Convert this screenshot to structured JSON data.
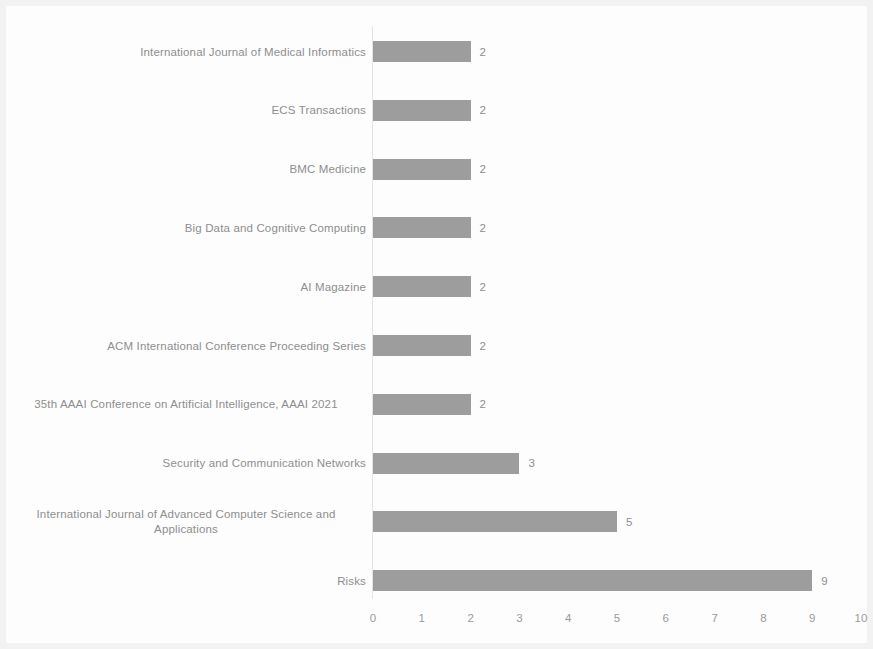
{
  "chart_data": {
    "type": "bar",
    "orientation": "horizontal",
    "title": "",
    "xlabel": "",
    "ylabel": "",
    "xlim": [
      0,
      10
    ],
    "xticks": [
      "0",
      "1",
      "2",
      "3",
      "4",
      "5",
      "6",
      "7",
      "8",
      "9",
      "10"
    ],
    "grid": false,
    "legend": false,
    "bar_color": "#9d9d9d",
    "label_color": "#8e8e8e",
    "categories": [
      "International Journal of Medical Informatics",
      "ECS Transactions",
      "BMC Medicine",
      "Big Data and Cognitive Computing",
      "AI Magazine",
      "ACM International Conference Proceeding Series",
      "35th AAAI Conference on Artificial Intelligence, AAAI 2021",
      "Security and Communication Networks",
      "International Journal of Advanced Computer Science and Applications",
      "Risks"
    ],
    "values": [
      2,
      2,
      2,
      2,
      2,
      2,
      2,
      3,
      5,
      9
    ],
    "value_labels": [
      "2",
      "2",
      "2",
      "2",
      "2",
      "2",
      "2",
      "3",
      "5",
      "9"
    ]
  }
}
